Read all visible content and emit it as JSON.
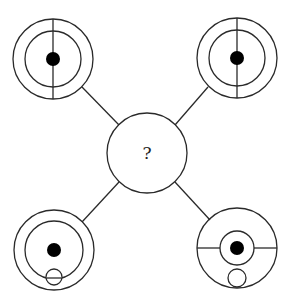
{
  "puzzle": {
    "center": {
      "label": "?",
      "cx": 147,
      "cy": 153,
      "r": 40
    },
    "stroke_color": "#2a2a2a",
    "fill_color": "#000000",
    "nodes": [
      {
        "id": "top-left",
        "cx": 53,
        "cy": 59,
        "outer_r": 40,
        "inner_r": 28,
        "dot_r": 7,
        "vertical_line": true,
        "horizontal_line": false,
        "small_circle": null
      },
      {
        "id": "top-right",
        "cx": 237,
        "cy": 58,
        "outer_r": 40,
        "inner_r": 28,
        "dot_r": 7,
        "vertical_line": true,
        "horizontal_line": false,
        "small_circle": null
      },
      {
        "id": "bottom-left",
        "cx": 54,
        "cy": 250,
        "outer_r": 40,
        "inner_r": 29,
        "dot_r": 7,
        "vertical_line": false,
        "horizontal_line": false,
        "small_circle": {
          "cx": 54,
          "cy": 277,
          "r": 8,
          "inner_chord": true
        }
      },
      {
        "id": "bottom-right",
        "cx": 237,
        "cy": 248,
        "outer_r": 40,
        "inner_r": 17,
        "dot_r": 7,
        "vertical_line": false,
        "horizontal_line": true,
        "small_circle": {
          "cx": 237,
          "cy": 278,
          "r": 9,
          "inner_chord": false
        }
      }
    ],
    "connectors": [
      {
        "from": "top-left",
        "x1": 82,
        "y1": 87,
        "x2": 119,
        "y2": 125
      },
      {
        "from": "top-right",
        "x1": 208,
        "y1": 87,
        "x2": 175,
        "y2": 125
      },
      {
        "from": "bottom-left",
        "x1": 82,
        "y1": 222,
        "x2": 119,
        "y2": 182
      },
      {
        "from": "bottom-right",
        "x1": 175,
        "y1": 182,
        "x2": 210,
        "y2": 220
      }
    ]
  }
}
